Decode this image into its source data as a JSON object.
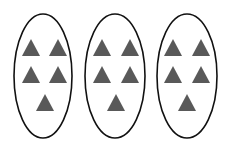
{
  "diagram": {
    "group_count": 3,
    "items_per_group": 5,
    "item_shape": "triangle",
    "colors": {
      "ellipse_stroke": "#111111",
      "triangle_fill": "#595959",
      "background": "#ffffff"
    },
    "groups": [
      {
        "cx": 43,
        "cy": 76,
        "rx": 29,
        "ry": 62
      },
      {
        "cx": 115,
        "cy": 76,
        "rx": 30,
        "ry": 62
      },
      {
        "cx": 187,
        "cy": 76,
        "rx": 30,
        "ry": 62
      }
    ]
  }
}
